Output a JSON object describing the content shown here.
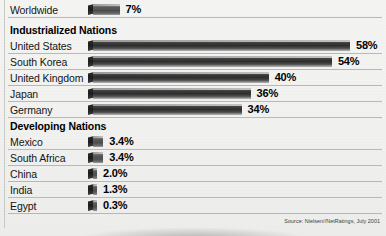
{
  "chart_data": {
    "type": "bar",
    "title": "",
    "xlabel": "",
    "ylabel": "",
    "orientation": "horizontal",
    "value_suffix": "%",
    "xlim": [
      0,
      58
    ],
    "grid": false,
    "legend": false,
    "source": "Source: Nielsen//NetRatings, July 2001",
    "groups": [
      {
        "heading": "",
        "rows": [
          {
            "label": "Worldwide",
            "value": 7,
            "value_label": "7%"
          }
        ]
      },
      {
        "heading": "Industrialized Nations",
        "rows": [
          {
            "label": "United States",
            "value": 58,
            "value_label": "58%"
          },
          {
            "label": "South Korea",
            "value": 54,
            "value_label": "54%"
          },
          {
            "label": "United Kingdom",
            "value": 40,
            "value_label": "40%"
          },
          {
            "label": "Japan",
            "value": 36,
            "value_label": "36%"
          },
          {
            "label": "Germany",
            "value": 34,
            "value_label": "34%"
          }
        ]
      },
      {
        "heading": "Developing Nations",
        "rows": [
          {
            "label": "Mexico",
            "value": 3.4,
            "value_label": "3.4%"
          },
          {
            "label": "South Africa",
            "value": 3.4,
            "value_label": "3.4%"
          },
          {
            "label": "China",
            "value": 2.0,
            "value_label": "2.0%"
          },
          {
            "label": "India",
            "value": 1.3,
            "value_label": "1.3%"
          },
          {
            "label": "Egypt",
            "value": 0.3,
            "value_label": "0.3%"
          }
        ]
      }
    ],
    "categories": [
      "Worldwide",
      "United States",
      "South Korea",
      "United Kingdom",
      "Japan",
      "Germany",
      "Mexico",
      "South Africa",
      "China",
      "India",
      "Egypt"
    ],
    "values": [
      7,
      58,
      54,
      40,
      36,
      34,
      3.4,
      3.4,
      2.0,
      1.3,
      0.3
    ],
    "colors": {
      "background": "#f2f2f0",
      "bar_dark": "#2e2e2e",
      "bar_light": "#9b9b98",
      "rule": "#b9b9b4",
      "text": "#141414"
    }
  }
}
